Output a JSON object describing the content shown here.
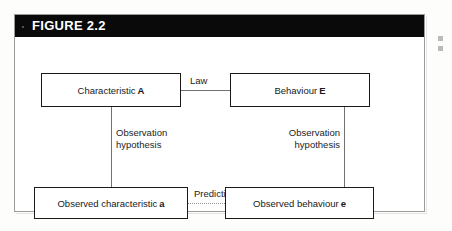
{
  "figure": {
    "title": "FIGURE 2.2",
    "header_bg": "#0a0a0a",
    "header_text_color": "#ffffff",
    "frame_border_color": "#9a9a9a"
  },
  "diagram": {
    "type": "flow-diagram",
    "nodes": [
      {
        "id": "characteristic-a",
        "text": "Characteristic",
        "emphasis": "A",
        "position": "top-left"
      },
      {
        "id": "behaviour-e",
        "text": "Behaviour",
        "emphasis": "E",
        "position": "top-right"
      },
      {
        "id": "observed-characteristic-a",
        "text": "Observed characteristic",
        "emphasis": "a",
        "position": "bottom-left"
      },
      {
        "id": "observed-behaviour-e",
        "text": "Observed behaviour",
        "emphasis": "e",
        "position": "bottom-right"
      }
    ],
    "edges": [
      {
        "id": "law",
        "label": "Law",
        "from": "characteristic-a",
        "to": "behaviour-e",
        "style": "solid"
      },
      {
        "id": "observation-hypothesis-left",
        "label_line1": "Observation",
        "label_line2": "hypothesis",
        "from": "characteristic-a",
        "to": "observed-characteristic-a",
        "style": "solid"
      },
      {
        "id": "observation-hypothesis-right",
        "label_line1": "Observation",
        "label_line2": "hypothesis",
        "from": "behaviour-e",
        "to": "observed-behaviour-e",
        "style": "solid"
      },
      {
        "id": "prediction",
        "label": "Prediction",
        "from": "observed-characteristic-a",
        "to": "observed-behaviour-e",
        "style": "dotted"
      }
    ]
  }
}
